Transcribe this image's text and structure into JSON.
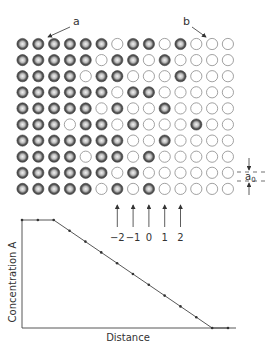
{
  "diagram": {
    "labels": {
      "a": "a",
      "b": "b",
      "a0": "a",
      "a0_sub": "0",
      "plane_labels": [
        "−2",
        "−1",
        "0",
        "1",
        "2"
      ]
    },
    "lattice": {
      "rows": 10,
      "cols": 14,
      "legend": {
        "F": "filled atom (A)",
        "E": "empty / other atom"
      },
      "grid": [
        "FFFFFFEFFEFEEE",
        "FFFFFEFFEFEEEE",
        "FFFFEFFEEEFEEE",
        "FFFFFFEFFEEEEE",
        "FFFFFEFEEFEEEE",
        "FFFEFFEFEEEFEE",
        "FFFFFFFEEFEEEE",
        "FFFFEFFEFEEEEE",
        "FFFFFFEFEEEEEE",
        "FFFFFEFEFEEEEE"
      ]
    },
    "colors": {
      "filled_outer": "#555555",
      "filled_inner": "#cfcfcf",
      "empty_stroke": "#8a8a8a",
      "line": "#444444"
    }
  },
  "chart_data": {
    "type": "line",
    "title": "",
    "xlabel": "Distance",
    "ylabel": "Concentration A",
    "x": [
      0,
      1,
      2,
      3,
      4,
      5,
      6,
      7,
      8,
      9,
      10,
      11,
      12,
      13
    ],
    "values": [
      1.0,
      1.0,
      1.0,
      0.9,
      0.8,
      0.7,
      0.6,
      0.5,
      0.4,
      0.3,
      0.2,
      0.1,
      0.0,
      0.0
    ],
    "grid": false,
    "legend": "none",
    "ylim": [
      0,
      1
    ],
    "xlim": [
      0,
      13
    ]
  }
}
